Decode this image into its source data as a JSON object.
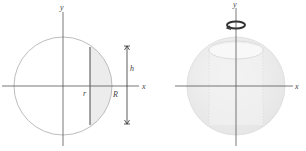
{
  "figure": {
    "left": {
      "axis_x_label": "x",
      "axis_y_label": "y",
      "inner_radius_label": "r",
      "outer_radius_label": "R",
      "height_label": "h",
      "shaded_region": "cap-segment-between-r-and-R"
    },
    "right": {
      "axis_x_label": "x",
      "axis_y_label": "y",
      "rotation_icon": "rotation-arrow-icon",
      "solid": "sphere-with-cylindrical-hole"
    },
    "colors": {
      "axis": "#555555",
      "circle": "#bdbdbd",
      "shade": "#ececec",
      "chord": "#666666",
      "sphere_fill": "#eeeeee",
      "arrow": "#333333"
    }
  }
}
